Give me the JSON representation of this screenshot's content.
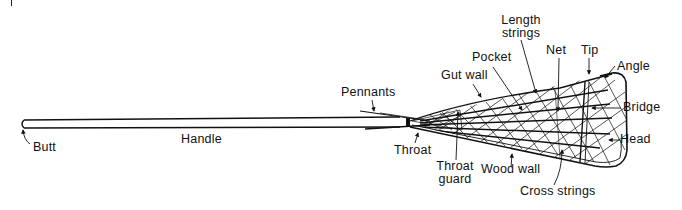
{
  "diagram": {
    "colors": {
      "ink": "#111111",
      "background": "#ffffff"
    },
    "labels": {
      "butt": "Butt",
      "handle": "Handle",
      "pennants": "Pennants",
      "throat": "Throat",
      "throat_guard_line1": "Throat",
      "throat_guard_line2": "guard",
      "gut_wall": "Gut wall",
      "pocket": "Pocket",
      "length_strings_line1": "Length",
      "length_strings_line2": "strings",
      "net": "Net",
      "tip": "Tip",
      "angle": "Angle",
      "bridge": "Bridge",
      "head": "Head",
      "wood_wall": "Wood wall",
      "cross_strings": "Cross strings"
    }
  }
}
